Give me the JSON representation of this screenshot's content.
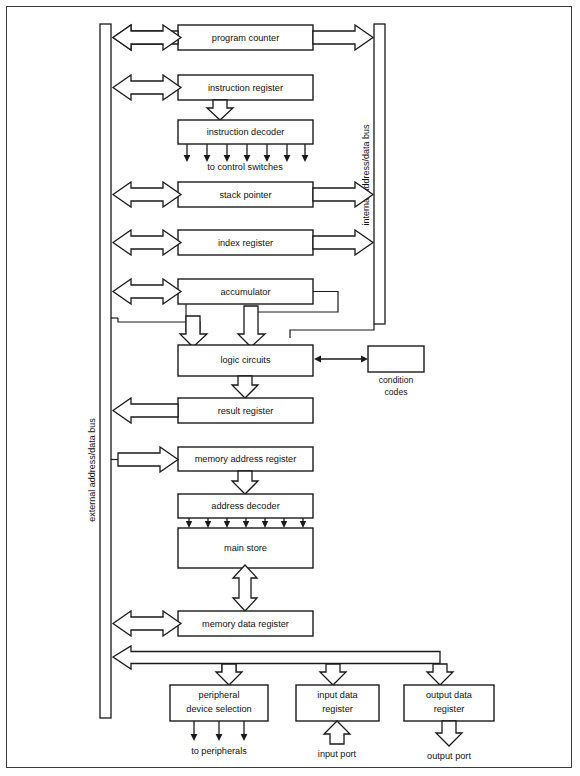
{
  "figure": {
    "type": "block-diagram",
    "background": "#ffffff",
    "line_color": "#1a1a1a"
  },
  "buses": {
    "external": {
      "label": "external address/data bus",
      "orientation": "vertical"
    },
    "internal": {
      "label": "internal address/data bus",
      "orientation": "vertical"
    }
  },
  "blocks": {
    "program_counter": "program counter",
    "instruction_register": "instruction register",
    "instruction_decoder": "instruction decoder",
    "stack_pointer": "stack pointer",
    "index_register": "index register",
    "accumulator": "accumulator",
    "logic_circuits": "logic circuits",
    "condition_codes_line1": "condition",
    "condition_codes_line2": "codes",
    "result_register": "result register",
    "memory_address_register": "memory address register",
    "address_decoder": "address decoder",
    "main_store": "main store",
    "memory_data_register": "memory data register",
    "peripheral_device_selection_line1": "peripheral",
    "peripheral_device_selection_line2": "device selection",
    "input_data_register_line1": "input data",
    "input_data_register_line2": "register",
    "output_data_register_line1": "output data",
    "output_data_register_line2": "register"
  },
  "annotations": {
    "to_control_switches": "to control switches",
    "to_peripherals": "to peripherals",
    "input_port": "input port",
    "output_port": "output port"
  },
  "fanouts": {
    "control_switches_count": 7,
    "address_decoder_count": 7,
    "peripherals_count": 3
  }
}
